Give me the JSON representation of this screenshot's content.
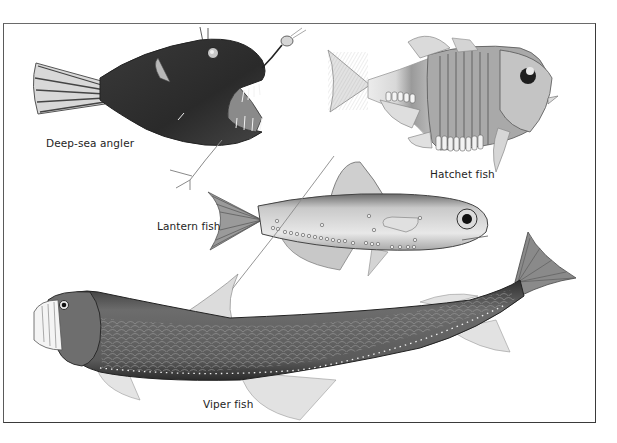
{
  "plate": {
    "subject": "Deep-sea fishes illustration",
    "colors": {
      "background": "#ffffff",
      "frame": "#4a4a4a",
      "ink": "#1e1e1e"
    }
  },
  "labels": {
    "angler": "Deep-sea angler",
    "hatchet": "Hatchet fish",
    "lantern": "Lantern fish",
    "viper": "Viper fish"
  },
  "figures": [
    {
      "name": "Deep-sea angler",
      "tone": "dark"
    },
    {
      "name": "Hatchet fish",
      "tone": "light-silver"
    },
    {
      "name": "Lantern fish",
      "tone": "silver"
    },
    {
      "name": "Viper fish",
      "tone": "dark-scaled"
    }
  ]
}
